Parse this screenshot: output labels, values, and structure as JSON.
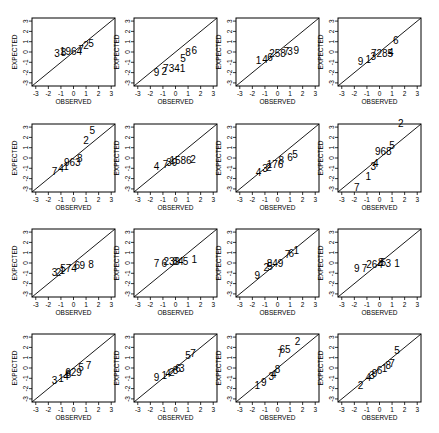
{
  "chart_data": {
    "type": "scatter",
    "xlabel": "OBSERVED",
    "ylabel": "EXPECTED",
    "xticks": [
      "-3",
      "-2",
      "-1",
      "0",
      "1",
      "2",
      "3"
    ],
    "yticks": [
      "-3",
      "-2",
      "-1",
      "0",
      "1",
      "2",
      "3"
    ],
    "xlim": [
      -3.3,
      3.3
    ],
    "ylim": [
      -3.3,
      3.3
    ],
    "panels": [
      {
        "labels": [
          {
            "t": "3",
            "x": -1.3,
            "y": -0.2
          },
          {
            "t": "8",
            "x": -0.8,
            "y": -0.15
          },
          {
            "t": "1964",
            "x": -0.2,
            "y": -0.05
          },
          {
            "t": "7",
            "x": 0.6,
            "y": 0.2
          },
          {
            "t": "2",
            "x": 1.0,
            "y": 0.5
          },
          {
            "t": "5",
            "x": 1.4,
            "y": 0.7
          }
        ]
      },
      {
        "labels": [
          {
            "t": "9",
            "x": -1.5,
            "y": -2.1
          },
          {
            "t": "2",
            "x": -0.9,
            "y": -2.0
          },
          {
            "t": "7341",
            "x": -0.1,
            "y": -1.7
          },
          {
            "t": "5",
            "x": 0.6,
            "y": -0.7
          },
          {
            "t": "8",
            "x": 1.0,
            "y": -0.1
          },
          {
            "t": "6",
            "x": 1.5,
            "y": 0.1
          }
        ]
      },
      {
        "labels": [
          {
            "t": "1",
            "x": -1.5,
            "y": -0.9
          },
          {
            "t": "4",
            "x": -1.0,
            "y": -0.8
          },
          {
            "t": "6",
            "x": -0.6,
            "y": -0.6
          },
          {
            "t": "258",
            "x": 0.0,
            "y": -0.2
          },
          {
            "t": "7",
            "x": 0.7,
            "y": 0.0
          },
          {
            "t": "3",
            "x": 1.0,
            "y": 0.0
          },
          {
            "t": "9",
            "x": 1.5,
            "y": 0.1
          }
        ]
      },
      {
        "labels": [
          {
            "t": "9",
            "x": -1.5,
            "y": -1.0
          },
          {
            "t": "1",
            "x": -0.9,
            "y": -0.8
          },
          {
            "t": "3",
            "x": -0.5,
            "y": -0.5
          },
          {
            "t": "7285",
            "x": 0.2,
            "y": -0.2
          },
          {
            "t": "4",
            "x": 0.9,
            "y": -0.1
          },
          {
            "t": "6",
            "x": 1.3,
            "y": 1.0
          }
        ]
      },
      {
        "labels": [
          {
            "t": "7",
            "x": -1.5,
            "y": -1.4
          },
          {
            "t": "4",
            "x": -1.0,
            "y": -1.1
          },
          {
            "t": "1",
            "x": -0.6,
            "y": -0.9
          },
          {
            "t": "963",
            "x": -0.1,
            "y": -0.5
          },
          {
            "t": "8",
            "x": 0.5,
            "y": -0.1
          },
          {
            "t": "2",
            "x": 1.0,
            "y": 1.6
          },
          {
            "t": "5",
            "x": 1.5,
            "y": 2.6
          }
        ]
      },
      {
        "labels": [
          {
            "t": "4",
            "x": -1.5,
            "y": -0.9
          },
          {
            "t": "7",
            "x": -0.8,
            "y": -0.7
          },
          {
            "t": "39",
            "x": -0.3,
            "y": -0.5
          },
          {
            "t": "1586",
            "x": 0.4,
            "y": -0.3
          },
          {
            "t": "2",
            "x": 1.4,
            "y": -0.2
          }
        ]
      },
      {
        "labels": [
          {
            "t": "4",
            "x": -1.5,
            "y": -1.5
          },
          {
            "t": "3",
            "x": -1.0,
            "y": -1.1
          },
          {
            "t": "2",
            "x": -0.7,
            "y": -1.0
          },
          {
            "t": "176",
            "x": -0.2,
            "y": -0.7
          },
          {
            "t": "8",
            "x": 0.3,
            "y": -0.3
          },
          {
            "t": "6",
            "x": 1.0,
            "y": 0.0
          },
          {
            "t": "5",
            "x": 1.4,
            "y": 0.3
          }
        ]
      },
      {
        "labels": [
          {
            "t": "7",
            "x": -1.8,
            "y": -2.9
          },
          {
            "t": "1",
            "x": -0.9,
            "y": -1.9
          },
          {
            "t": "3",
            "x": -0.5,
            "y": -0.9
          },
          {
            "t": "4",
            "x": -0.3,
            "y": -0.6
          },
          {
            "t": "968",
            "x": 0.3,
            "y": 0.5
          },
          {
            "t": "5",
            "x": 1.0,
            "y": 1.1
          },
          {
            "t": "2",
            "x": 1.7,
            "y": 3.3
          }
        ]
      },
      {
        "labels": [
          {
            "t": "3",
            "x": -1.5,
            "y": -1.0
          },
          {
            "t": "2",
            "x": -1.2,
            "y": -1.0
          },
          {
            "t": "1",
            "x": -0.9,
            "y": -0.8
          },
          {
            "t": "574",
            "x": -0.4,
            "y": -0.6
          },
          {
            "t": "6",
            "x": 0.3,
            "y": -0.3
          },
          {
            "t": "9",
            "x": 0.7,
            "y": -0.3
          },
          {
            "t": "8",
            "x": 1.4,
            "y": -0.2
          }
        ]
      },
      {
        "labels": [
          {
            "t": "7",
            "x": -1.5,
            "y": -0.1
          },
          {
            "t": "6",
            "x": -0.9,
            "y": -0.1
          },
          {
            "t": "239",
            "x": -0.3,
            "y": 0.1
          },
          {
            "t": "84",
            "x": 0.2,
            "y": 0.1
          },
          {
            "t": "5",
            "x": 0.8,
            "y": 0.1
          },
          {
            "t": "1",
            "x": 1.5,
            "y": 0.3
          }
        ]
      },
      {
        "labels": [
          {
            "t": "9",
            "x": -1.6,
            "y": -1.3
          },
          {
            "t": "2",
            "x": -0.9,
            "y": -0.5
          },
          {
            "t": "5",
            "x": -0.6,
            "y": -0.4
          },
          {
            "t": "849",
            "x": -0.2,
            "y": -0.1
          },
          {
            "t": "7",
            "x": 0.8,
            "y": 0.7
          },
          {
            "t": "6",
            "x": 1.1,
            "y": 0.8
          },
          {
            "t": "1",
            "x": 1.5,
            "y": 1.1
          }
        ]
      },
      {
        "labels": [
          {
            "t": "9",
            "x": -1.8,
            "y": -0.6
          },
          {
            "t": "7",
            "x": -1.2,
            "y": -0.6
          },
          {
            "t": "264",
            "x": -0.4,
            "y": -0.2
          },
          {
            "t": "8",
            "x": 0.1,
            "y": 0.0
          },
          {
            "t": "5",
            "x": 0.3,
            "y": 0.0
          },
          {
            "t": "3",
            "x": 0.7,
            "y": -0.1
          },
          {
            "t": "1",
            "x": 1.4,
            "y": -0.1
          }
        ]
      },
      {
        "labels": [
          {
            "t": "3",
            "x": -1.5,
            "y": -1.3
          },
          {
            "t": "1",
            "x": -1.0,
            "y": -1.1
          },
          {
            "t": "4",
            "x": -0.6,
            "y": -0.9
          },
          {
            "t": "8",
            "x": -0.4,
            "y": -0.7
          },
          {
            "t": "629",
            "x": 0.0,
            "y": -0.5
          },
          {
            "t": "5",
            "x": 0.6,
            "y": 0.0
          },
          {
            "t": "7",
            "x": 1.2,
            "y": 0.2
          }
        ]
      },
      {
        "labels": [
          {
            "t": "9",
            "x": -1.5,
            "y": -1.0
          },
          {
            "t": "1",
            "x": -0.9,
            "y": -0.8
          },
          {
            "t": "4",
            "x": -0.6,
            "y": -0.6
          },
          {
            "t": "2",
            "x": -0.3,
            "y": -0.5
          },
          {
            "t": "8",
            "x": 0.0,
            "y": -0.3
          },
          {
            "t": "6",
            "x": 0.2,
            "y": -0.1
          },
          {
            "t": "3",
            "x": 0.5,
            "y": -0.1
          },
          {
            "t": "5",
            "x": 1.0,
            "y": 1.1
          },
          {
            "t": "7",
            "x": 1.4,
            "y": 1.3
          }
        ]
      },
      {
        "labels": [
          {
            "t": "1",
            "x": -1.6,
            "y": -1.8
          },
          {
            "t": "9",
            "x": -1.1,
            "y": -1.5
          },
          {
            "t": "3",
            "x": -0.5,
            "y": -0.9
          },
          {
            "t": "4",
            "x": -0.3,
            "y": -0.7
          },
          {
            "t": "8",
            "x": 0.0,
            "y": -0.2
          },
          {
            "t": "7",
            "x": 0.2,
            "y": 1.3
          },
          {
            "t": "65",
            "x": 0.6,
            "y": 1.7
          },
          {
            "t": "2",
            "x": 1.6,
            "y": 2.5
          }
        ]
      },
      {
        "labels": [
          {
            "t": "2",
            "x": -1.5,
            "y": -1.8
          },
          {
            "t": "4",
            "x": -0.9,
            "y": -1.0
          },
          {
            "t": "3",
            "x": -0.6,
            "y": -0.8
          },
          {
            "t": "9",
            "x": -0.4,
            "y": -0.6
          },
          {
            "t": "6",
            "x": 0.0,
            "y": -0.3
          },
          {
            "t": "1",
            "x": 0.4,
            "y": -0.1
          },
          {
            "t": "8",
            "x": 0.7,
            "y": 0.2
          },
          {
            "t": "7",
            "x": 1.0,
            "y": 0.4
          },
          {
            "t": "5",
            "x": 1.4,
            "y": 1.6
          }
        ]
      }
    ]
  },
  "layout": {
    "cols_x": [
      32,
      134,
      236,
      338
    ],
    "rows_y": [
      18,
      124,
      229,
      334
    ],
    "box_w": 83,
    "box_h": 68
  }
}
